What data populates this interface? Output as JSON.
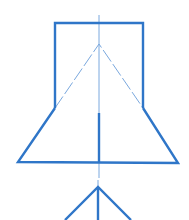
{
  "diagram": {
    "stroke_color": "#2f76c8",
    "thin_stroke_color": "#7aa8de",
    "background": "#ffffff",
    "shapes": {
      "rectangle": {
        "x1": 55,
        "y1": 23,
        "x2": 143,
        "y2": 108
      },
      "center_axis": {
        "x": 99,
        "y1": 15,
        "y2": 178
      },
      "center_thick_segment": {
        "x": 99,
        "y1": 113,
        "y2": 162
      },
      "inner_triangle": {
        "apex": [
          99,
          44
        ],
        "left": [
          55,
          108
        ],
        "right": [
          143,
          108
        ]
      },
      "trapezoid": {
        "top_left": [
          55,
          108
        ],
        "top_right": [
          143,
          108
        ],
        "bottom_left": [
          18,
          162
        ],
        "bottom_right": [
          178,
          163
        ]
      },
      "bottom_triangle": {
        "apex": [
          98,
          187
        ],
        "left": [
          65,
          220
        ],
        "right": [
          131,
          220
        ],
        "stem_y2": 220
      }
    }
  }
}
